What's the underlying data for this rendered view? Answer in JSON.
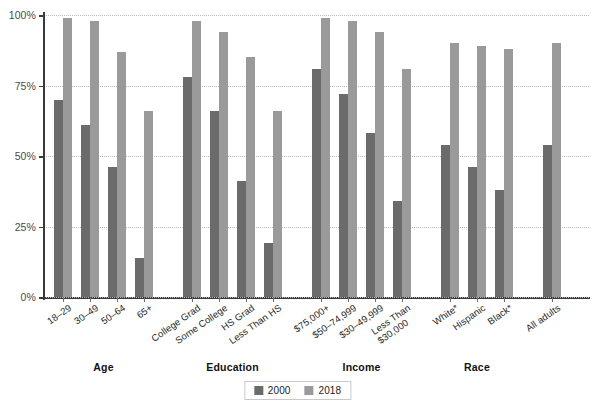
{
  "chart_data": {
    "type": "bar",
    "title": "",
    "xlabel": "",
    "ylabel": "",
    "ylim": [
      0,
      100
    ],
    "yticks": [
      0,
      25,
      50,
      75,
      100
    ],
    "ytick_labels": [
      "0%",
      "25%",
      "50%",
      "75%",
      "100%"
    ],
    "grid": true,
    "legend_position": "bottom-center",
    "categories": [
      "18–29",
      "30–49",
      "50–64",
      "65+",
      "College Grad",
      "Some College",
      "HS Grad",
      "Less Than HS",
      "$75,000+",
      "$50–74,999",
      "$30–49,999",
      "Less Than $30,000",
      "White*",
      "Hispanic",
      "Black*",
      "All adults"
    ],
    "series": [
      {
        "name": "2000",
        "color": "#6b6b6b",
        "values": [
          70,
          61,
          46,
          14,
          78,
          66,
          41,
          19,
          81,
          72,
          58,
          34,
          54,
          46,
          38,
          54
        ]
      },
      {
        "name": "2018",
        "color": "#9a9a9a",
        "values": [
          99,
          98,
          87,
          66,
          98,
          94,
          85,
          66,
          99,
          98,
          94,
          81,
          90,
          89,
          88,
          90
        ]
      }
    ],
    "groups": [
      {
        "label": "Age",
        "categories": [
          "18–29",
          "30–49",
          "50–64",
          "65+"
        ]
      },
      {
        "label": "Education",
        "categories": [
          "College Grad",
          "Some College",
          "HS Grad",
          "Less Than HS"
        ]
      },
      {
        "label": "Income",
        "categories": [
          "$75,000+",
          "$50–74,999",
          "$30–49,999",
          "Less Than $30,000"
        ]
      },
      {
        "label": "Race",
        "categories": [
          "White*",
          "Hispanic",
          "Black*"
        ]
      },
      {
        "label": "",
        "categories": [
          "All adults"
        ]
      }
    ]
  },
  "axis": {
    "y": {
      "ticks": [
        {
          "value": 100,
          "label": "100%"
        },
        {
          "value": 75,
          "label": "75%"
        },
        {
          "value": 50,
          "label": "50%"
        },
        {
          "value": 25,
          "label": "25%"
        },
        {
          "value": 0,
          "label": "0%"
        }
      ]
    },
    "x": {
      "labels": [
        {
          "line1": "18–29",
          "line2": ""
        },
        {
          "line1": "30–49",
          "line2": ""
        },
        {
          "line1": "50–64",
          "line2": ""
        },
        {
          "line1": "65+",
          "line2": ""
        },
        {
          "line1": "College Grad",
          "line2": ""
        },
        {
          "line1": "Some College",
          "line2": ""
        },
        {
          "line1": "HS Grad",
          "line2": ""
        },
        {
          "line1": "Less Than HS",
          "line2": ""
        },
        {
          "line1": "$75,000+",
          "line2": ""
        },
        {
          "line1": "$50–74,999",
          "line2": ""
        },
        {
          "line1": "$30–49,999",
          "line2": ""
        },
        {
          "line1": "Less Than",
          "line2": "$30,000"
        },
        {
          "line1": "White*",
          "line2": ""
        },
        {
          "line1": "Hispanic",
          "line2": ""
        },
        {
          "line1": "Black*",
          "line2": ""
        },
        {
          "line1": "All adults",
          "line2": ""
        }
      ]
    }
  },
  "group_labels": [
    {
      "label": "Age"
    },
    {
      "label": "Education"
    },
    {
      "label": "Income"
    },
    {
      "label": "Race"
    }
  ],
  "legend": {
    "items": [
      {
        "label": "2000",
        "color": "#6b6b6b"
      },
      {
        "label": "2018",
        "color": "#9a9a9a"
      }
    ]
  },
  "colors": {
    "series_2000": "#6b6b6b",
    "series_2018": "#9a9a9a",
    "axis": "#3a3a3a",
    "grid": "#b9b9b9",
    "text": "#231f20",
    "background": "#ffffff"
  }
}
